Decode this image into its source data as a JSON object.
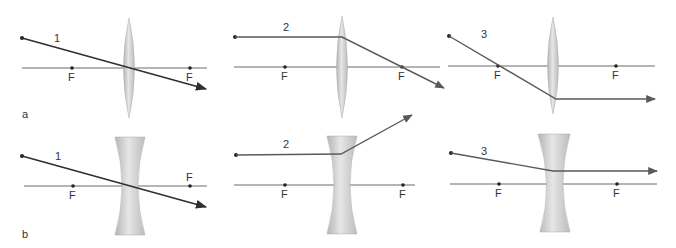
{
  "rows": [
    {
      "label": "a",
      "lens_type": "converging"
    },
    {
      "label": "b",
      "lens_type": "diverging"
    }
  ],
  "panels": [
    {
      "row": "a",
      "ray_number": "1",
      "focal_left": "F",
      "focal_right": "F",
      "description": "Ray through optical center continues undeviated"
    },
    {
      "row": "a",
      "ray_number": "2",
      "focal_left": "F",
      "focal_right": "F",
      "description": "Ray parallel to axis refracts through far focal point"
    },
    {
      "row": "a",
      "ray_number": "3",
      "focal_left": "F",
      "focal_right": "F",
      "description": "Ray through near focal point exits parallel to axis"
    },
    {
      "row": "b",
      "ray_number": "1",
      "focal_left": "F",
      "focal_right": "F",
      "description": "Ray through optical center continues undeviated"
    },
    {
      "row": "b",
      "ray_number": "2",
      "focal_left": "F",
      "focal_right": "F",
      "description": "Ray parallel to axis diverges as if from near focal point"
    },
    {
      "row": "b",
      "ray_number": "3",
      "focal_left": "F",
      "focal_right": "F",
      "description": "Ray aimed at far focal point exits parallel to axis"
    }
  ],
  "colors": {
    "axis": "#6b6b6b",
    "ray": "#2f2f2f",
    "lens_fill": "#c9c9c9",
    "background": "#ffffff"
  }
}
